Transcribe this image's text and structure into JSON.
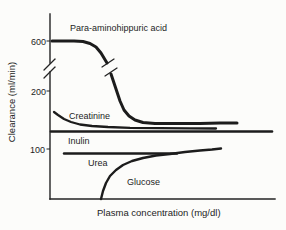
{
  "figure": {
    "background": "#fcfcfa",
    "ink_color": "#1c1c1c",
    "xlabel": "Plasma concentration (mg/dl)",
    "ylabel": "Clearance (ml/min)"
  },
  "chart_data": {
    "type": "line",
    "title": "",
    "xlabel": "Plasma concentration (mg/dl)",
    "ylabel": "Clearance (ml/min)",
    "x_axis_tick_labels": [],
    "y_tick_labels": [
      "600",
      "200",
      "100"
    ],
    "y_axis_break": "double-slash break on y-axis between 200 and 600; same break mark repeated on the Para-aminohippuric acid curve",
    "grid": false,
    "legend": "labels annotated next to each curve",
    "series": [
      {
        "name": "Para-aminohippuric acid",
        "shape": "plateau at 600 then sigmoidal fall to low plateau",
        "points_xfrac_clearance": [
          [
            0.01,
            600
          ],
          [
            0.15,
            600
          ],
          [
            0.2,
            570
          ],
          [
            0.24,
            460
          ],
          [
            0.27,
            330
          ],
          [
            0.31,
            210
          ],
          [
            0.35,
            160
          ],
          [
            0.42,
            147
          ],
          [
            0.6,
            144
          ],
          [
            0.83,
            144
          ]
        ]
      },
      {
        "name": "Creatinine",
        "shape": "slight fall then flat",
        "points_xfrac_clearance": [
          [
            0.02,
            163
          ],
          [
            0.07,
            152
          ],
          [
            0.13,
            143
          ],
          [
            0.22,
            138
          ],
          [
            0.4,
            136
          ],
          [
            0.74,
            135
          ]
        ]
      },
      {
        "name": "Inulin",
        "shape": "constant horizontal line",
        "points_xfrac_clearance": [
          [
            0.0,
            130
          ],
          [
            0.99,
            130
          ]
        ]
      },
      {
        "name": "Urea",
        "shape": "constant horizontal line",
        "points_xfrac_clearance": [
          [
            0.06,
            92
          ],
          [
            0.56,
            92
          ]
        ]
      },
      {
        "name": "Glucose",
        "shape": "zero below threshold then rises toward plateau",
        "points_xfrac_clearance": [
          [
            0.23,
            0
          ],
          [
            0.26,
            25
          ],
          [
            0.31,
            48
          ],
          [
            0.38,
            65
          ],
          [
            0.47,
            77
          ],
          [
            0.58,
            85
          ],
          [
            0.72,
            93
          ],
          [
            0.76,
            95
          ]
        ]
      }
    ]
  },
  "render": {
    "axes": [
      {
        "name": "y-axis-upper-segment",
        "points": [
          [
            50,
            14
          ],
          [
            50,
            63
          ]
        ]
      },
      {
        "name": "y-axis-lower-segment",
        "points": [
          [
            50,
            72
          ],
          [
            50,
            199
          ]
        ]
      },
      {
        "name": "x-axis",
        "points": [
          [
            50,
            199
          ],
          [
            275,
            199
          ]
        ]
      }
    ],
    "marks": [
      {
        "name": "y-axis-break-slash-1",
        "x1": 44,
        "y1": 70,
        "x2": 55,
        "y2": 59
      },
      {
        "name": "y-axis-break-slash-2",
        "x1": 44,
        "y1": 78,
        "x2": 55,
        "y2": 67
      },
      {
        "name": "curve-break-slash-1",
        "x1": 102,
        "y1": 67,
        "x2": 114,
        "y2": 59
      },
      {
        "name": "curve-break-slash-2",
        "x1": 105,
        "y1": 76,
        "x2": 117,
        "y2": 68
      }
    ],
    "yticks": [
      {
        "y": 41,
        "label_x": 46,
        "label_y": 44.5
      },
      {
        "y": 91,
        "label_x": 46,
        "label_y": 94.5
      },
      {
        "y": 149,
        "label_x": 45,
        "label_y": 152.5
      }
    ],
    "curves": [
      {
        "name": "curve-para-aminohippuric-acid-upper",
        "width": 3,
        "points": [
          [
            52,
            41
          ],
          [
            62,
            41
          ],
          [
            74,
            41
          ],
          [
            83,
            41.5
          ],
          [
            90,
            43.5
          ],
          [
            96,
            47
          ],
          [
            101,
            53
          ],
          [
            104,
            58
          ],
          [
            107,
            63
          ]
        ]
      },
      {
        "name": "curve-para-aminohippuric-acid-lower",
        "width": 3,
        "points": [
          [
            111,
            74
          ],
          [
            114,
            83
          ],
          [
            117,
            92
          ],
          [
            120,
            101
          ],
          [
            124,
            110
          ],
          [
            129,
            116
          ],
          [
            135,
            120
          ],
          [
            143,
            122.5
          ],
          [
            155,
            123.5
          ],
          [
            175,
            123.5
          ],
          [
            200,
            123.5
          ],
          [
            220,
            123
          ],
          [
            237,
            123
          ]
        ]
      },
      {
        "name": "curve-creatinine",
        "width": 2.3,
        "points": [
          [
            54,
            112
          ],
          [
            58,
            115
          ],
          [
            64,
            119
          ],
          [
            71,
            122
          ],
          [
            80,
            124.5
          ],
          [
            92,
            126
          ],
          [
            108,
            127
          ],
          [
            130,
            127.8
          ],
          [
            160,
            128.2
          ],
          [
            190,
            128.4
          ],
          [
            216,
            128.5
          ]
        ]
      },
      {
        "name": "curve-inulin",
        "width": 2.6,
        "points": [
          [
            51,
            131.5
          ],
          [
            272,
            131.5
          ]
        ]
      },
      {
        "name": "curve-urea",
        "width": 2.4,
        "points": [
          [
            64,
            153.5
          ],
          [
            177,
            153.5
          ]
        ]
      },
      {
        "name": "curve-glucose",
        "width": 2.4,
        "points": [
          [
            101,
            199
          ],
          [
            103,
            191
          ],
          [
            106,
            183
          ],
          [
            110,
            176
          ],
          [
            116,
            170
          ],
          [
            123,
            165
          ],
          [
            132,
            161
          ],
          [
            143,
            158
          ],
          [
            156,
            155.5
          ],
          [
            170,
            154
          ],
          [
            185,
            152
          ],
          [
            200,
            150.5
          ],
          [
            212,
            149.5
          ],
          [
            221,
            148.5
          ]
        ]
      }
    ],
    "texts": [
      {
        "name": "label-para-aminohippuric-acid",
        "x": 70,
        "y": 31,
        "fs": 9,
        "bind": "chart_data.series.0.name"
      },
      {
        "name": "label-creatinine",
        "x": 69,
        "y": 118.5,
        "fs": 9,
        "bind": "chart_data.series.1.name"
      },
      {
        "name": "label-inulin",
        "x": 68,
        "y": 144,
        "fs": 9,
        "bind": "chart_data.series.2.name"
      },
      {
        "name": "label-urea",
        "x": 88,
        "y": 166,
        "fs": 9,
        "bind": "chart_data.series.3.name"
      },
      {
        "name": "label-glucose",
        "x": 127,
        "y": 185,
        "fs": 9,
        "bind": "chart_data.series.4.name"
      },
      {
        "name": "x-axis-label",
        "x": 97,
        "y": 215.5,
        "fs": 9.5,
        "bind": "figure.xlabel"
      },
      {
        "name": "y-axis-label",
        "x": 14.5,
        "y": 102,
        "fs": 9.5,
        "rotate": true,
        "anchor": "middle",
        "bind": "figure.ylabel"
      }
    ]
  }
}
